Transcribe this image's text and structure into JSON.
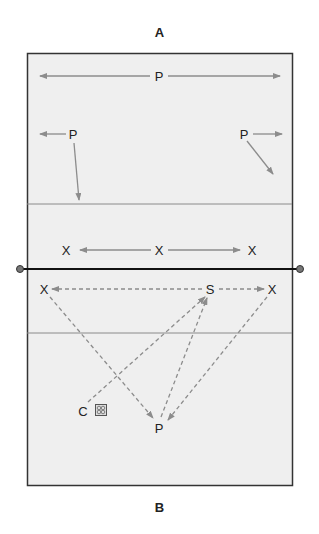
{
  "diagram": {
    "title_top": "A",
    "title_bottom": "B",
    "colors": {
      "court_fill": "#efefef",
      "court_border": "#333333",
      "net": "#111111",
      "lines": "#8a8a8a",
      "arrows": "#8c8c8c",
      "text": "#222222"
    },
    "players_top": [
      {
        "id": "p-top-center",
        "label": "P"
      },
      {
        "id": "p-top-left",
        "label": "P"
      },
      {
        "id": "p-top-right",
        "label": "P"
      }
    ],
    "blockers": [
      {
        "id": "x-left",
        "label": "X"
      },
      {
        "id": "x-middle",
        "label": "X"
      },
      {
        "id": "x-right",
        "label": "X"
      }
    ],
    "bottom_side": {
      "x_left": "X",
      "setter": "S",
      "x_right": "X",
      "coach": "C",
      "passer": "P",
      "ball_icon": "volleyball-cart-icon"
    }
  }
}
